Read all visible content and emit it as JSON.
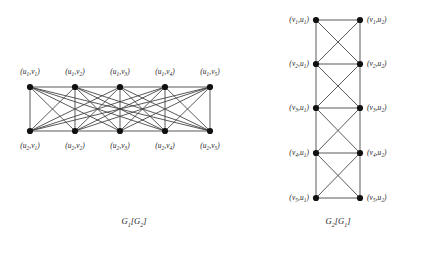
{
  "figure": {
    "background_color": "#ffffff",
    "node_color": "#111111",
    "edge_color": "#3c3c3c",
    "label_color": "#1a1a1a"
  },
  "left_graph": {
    "name": "G1[G2]",
    "caption": "G₁[G₂]",
    "caption_x": 134,
    "caption_y": 222,
    "structure": "complete join between the two rows plus row-internal G2 edges",
    "rows": [
      {
        "row_id": "top",
        "y": 87,
        "label_y": 72,
        "label_position": "above",
        "nodes": [
          {
            "id": "t1",
            "x": 30,
            "label": "(u₁,v₁)"
          },
          {
            "id": "t2",
            "x": 75,
            "label": "(u₁,v₂)"
          },
          {
            "id": "t3",
            "x": 120,
            "label": "(u₁,v₃)"
          },
          {
            "id": "t4",
            "x": 165,
            "label": "(u₁,v₄)"
          },
          {
            "id": "t5",
            "x": 210,
            "label": "(u₁,v₅)"
          }
        ]
      },
      {
        "row_id": "bottom",
        "y": 131,
        "label_y": 146,
        "label_position": "below",
        "nodes": [
          {
            "id": "b1",
            "x": 30,
            "label": "(u₂,v₁)"
          },
          {
            "id": "b2",
            "x": 75,
            "label": "(u₂,v₂)"
          },
          {
            "id": "b3",
            "x": 120,
            "label": "(u₂,v₃)"
          },
          {
            "id": "b4",
            "x": 165,
            "label": "(u₂,v₄)"
          },
          {
            "id": "b5",
            "x": 210,
            "label": "(u₂,v₅)"
          }
        ]
      }
    ],
    "row_internal_edges": [
      [
        "t1",
        "t2"
      ],
      [
        "t2",
        "t3"
      ],
      [
        "t3",
        "t4"
      ],
      [
        "t4",
        "t5"
      ],
      [
        "b1",
        "b2"
      ],
      [
        "b2",
        "b3"
      ],
      [
        "b3",
        "b4"
      ],
      [
        "b4",
        "b5"
      ]
    ],
    "cross_edges_complete_bipartite": true
  },
  "right_graph": {
    "name": "G2[G1]",
    "caption": "G₂[G₁]",
    "caption_x": 338,
    "caption_y": 222,
    "structure": "each consecutive row pair forms a complete K4",
    "columns": [
      {
        "column_id": "left",
        "x": 316,
        "label_suffix": "u₁",
        "label_side": "left"
      },
      {
        "column_id": "right",
        "x": 360,
        "label_suffix": "u₂",
        "label_side": "right"
      }
    ],
    "rows": [
      {
        "row_index": 1,
        "y": 20,
        "left": {
          "id": "l1",
          "label": "(v₁,u₁)"
        },
        "right": {
          "id": "r1",
          "label": "(v₁,u₂)"
        }
      },
      {
        "row_index": 2,
        "y": 64,
        "left": {
          "id": "l2",
          "label": "(v₂,u₁)"
        },
        "right": {
          "id": "r2",
          "label": "(v₂,u₂)"
        }
      },
      {
        "row_index": 3,
        "y": 108,
        "left": {
          "id": "l3",
          "label": "(v₃,u₁)"
        },
        "right": {
          "id": "r3",
          "label": "(v₃,u₂)"
        }
      },
      {
        "row_index": 4,
        "y": 153,
        "left": {
          "id": "l4",
          "label": "(v₄,u₁)"
        },
        "right": {
          "id": "r4",
          "label": "(v₄,u₂)"
        }
      },
      {
        "row_index": 5,
        "y": 198,
        "left": {
          "id": "l5",
          "label": "(v₅,u₁)"
        },
        "right": {
          "id": "r5",
          "label": "(v₅,u₂)"
        }
      }
    ],
    "rung_edges": [
      [
        "l1",
        "r1"
      ],
      [
        "l2",
        "r2"
      ],
      [
        "l3",
        "r3"
      ],
      [
        "l4",
        "r4"
      ],
      [
        "l5",
        "r5"
      ]
    ],
    "vertical_edges": [
      [
        "l1",
        "l2"
      ],
      [
        "l2",
        "l3"
      ],
      [
        "l3",
        "l4"
      ],
      [
        "l4",
        "l5"
      ],
      [
        "r1",
        "r2"
      ],
      [
        "r2",
        "r3"
      ],
      [
        "r3",
        "r4"
      ],
      [
        "r4",
        "r5"
      ]
    ],
    "diagonal_edges": [
      [
        "l1",
        "r2"
      ],
      [
        "r1",
        "l2"
      ],
      [
        "l2",
        "r3"
      ],
      [
        "r2",
        "l3"
      ],
      [
        "l3",
        "r4"
      ],
      [
        "r3",
        "l4"
      ],
      [
        "l4",
        "r5"
      ],
      [
        "r4",
        "l5"
      ]
    ]
  }
}
